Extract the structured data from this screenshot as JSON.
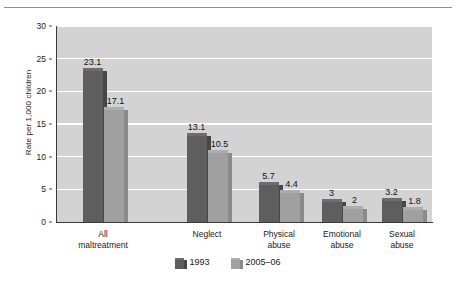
{
  "chart_data": {
    "type": "bar",
    "title": "",
    "subtitle": "",
    "xlabel": "",
    "ylabel": "Rate per 1,000 children",
    "ylim": [
      0,
      30
    ],
    "yticks": [
      0,
      5,
      10,
      15,
      20,
      25,
      30
    ],
    "ytick_labels": [
      "0",
      "5",
      "10",
      "15",
      "20",
      "25",
      "30"
    ],
    "grid": "horizontal-white",
    "legend_position": "bottom-center",
    "categories": [
      "All\nmaltreatment",
      "Neglect",
      "Physical\nabuse",
      "Emotional\nabuse",
      "Sexual\nabuse"
    ],
    "category_lines": [
      [
        "All",
        "maltreatment"
      ],
      [
        "Neglect",
        ""
      ],
      [
        "Physical",
        "abuse"
      ],
      [
        "Emotional",
        "abuse"
      ],
      [
        "Sexual",
        "abuse"
      ]
    ],
    "series": [
      {
        "name": "1993",
        "color": "#5e5e5e",
        "values": [
          23.1,
          13.1,
          5.7,
          3,
          3.2
        ],
        "value_labels": [
          "23.1",
          "13.1",
          "5.7",
          "3",
          "3.2"
        ]
      },
      {
        "name": "2005–06",
        "color": "#a0a0a0",
        "values": [
          17.1,
          10.5,
          4.4,
          2,
          1.8
        ],
        "value_labels": [
          "17.1",
          "10.5",
          "4.4",
          "2",
          "1.8"
        ]
      }
    ]
  },
  "legend": {
    "items": [
      {
        "label": "1993",
        "color": "#5e5e5e"
      },
      {
        "label": "2005–06",
        "color": "#a0a0a0"
      }
    ]
  },
  "axis": {
    "y_title": "Rate per 1,000 children"
  },
  "colors": {
    "plot_background": "#d3d3d3",
    "gridline": "#ffffff",
    "axis": "#3a3a3a",
    "series_1993": "#5e5e5e",
    "series_2005_06": "#a0a0a0",
    "page_background": "#ffffff",
    "top_rule": "#8e8e8e"
  }
}
